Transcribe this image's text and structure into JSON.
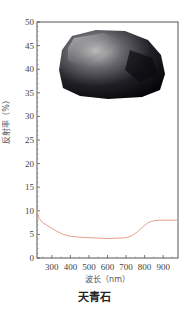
{
  "chart_data": {
    "type": "line",
    "title": "",
    "caption": "天青石",
    "xlabel": "波长（nm）",
    "ylabel": "反射率（%）",
    "xlim": [
      220,
      980
    ],
    "ylim": [
      0,
      50
    ],
    "x_ticks": [
      300,
      400,
      500,
      600,
      700,
      800,
      900
    ],
    "y_ticks": [
      0,
      5,
      10,
      15,
      20,
      25,
      30,
      35,
      40,
      45,
      50
    ],
    "grid": false,
    "legend": null,
    "line_color": "#e8a090",
    "series": [
      {
        "name": "天青石",
        "x": [
          220,
          230,
          250,
          280,
          320,
          360,
          400,
          450,
          500,
          550,
          600,
          650,
          700,
          730,
          760,
          790,
          820,
          850,
          880,
          920,
          960,
          980
        ],
        "values": [
          10.0,
          8.5,
          7.5,
          6.8,
          5.8,
          5.0,
          4.6,
          4.4,
          4.3,
          4.2,
          4.1,
          4.2,
          4.3,
          4.7,
          5.5,
          6.6,
          7.5,
          7.9,
          8.0,
          8.0,
          8.0,
          8.0
        ]
      }
    ],
    "inset_image": "mineral-specimen-photo"
  }
}
